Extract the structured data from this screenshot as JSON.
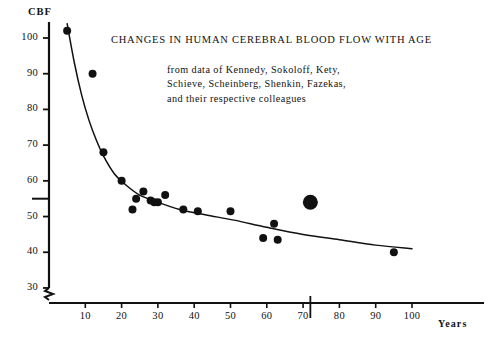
{
  "figure": {
    "title": "CHANGES IN HUMAN CEREBRAL BLOOD FLOW WITH AGE",
    "caption_lines": [
      "from data of Kennedy, Sokoloff, Kety,",
      "Schieve, Scheinberg, Shenkin, Fazekas,",
      "and their respective colleagues"
    ],
    "ink_color": "#111111",
    "background_color": "#ffffff"
  },
  "chart_data": {
    "type": "scatter",
    "title": "CHANGES IN HUMAN CEREBRAL BLOOD FLOW WITH AGE",
    "subtitle": "from data of Kennedy, Sokoloff, Kety, Schieve, Scheinberg, Shenkin, Fazekas, and their respective colleagues",
    "xlabel": "Years",
    "ylabel": "CBF",
    "xlim": [
      0,
      108
    ],
    "ylim": [
      26,
      106
    ],
    "grid": false,
    "legend": null,
    "axis_break": {
      "axis": "y",
      "below_value": 30,
      "symbol": "zigzag"
    },
    "xticks": [
      10,
      20,
      30,
      40,
      50,
      60,
      70,
      80,
      90,
      100
    ],
    "xtick_labels": [
      "10",
      "20",
      "30",
      "40",
      "50",
      "60",
      "70",
      "80",
      "90",
      "100"
    ],
    "yticks": [
      30,
      40,
      50,
      60,
      70,
      80,
      90,
      100
    ],
    "ytick_labels": [
      "30",
      "40",
      "50",
      "60",
      "70",
      "80",
      "90",
      "100"
    ],
    "reference_marks": [
      {
        "name": "y-reference-tick-55",
        "axis": "y",
        "value": 55,
        "style": "extended-tick"
      },
      {
        "name": "x-reference-line-72",
        "axis": "x",
        "value": 72,
        "style": "short-vertical-line"
      }
    ],
    "series": [
      {
        "name": "Observed CBF data points",
        "marker": "filled-circle",
        "color": "#111111",
        "points": [
          {
            "x": 5,
            "y": 102,
            "size": "normal"
          },
          {
            "x": 12,
            "y": 90,
            "size": "normal"
          },
          {
            "x": 15,
            "y": 68,
            "size": "normal"
          },
          {
            "x": 20,
            "y": 60,
            "size": "normal"
          },
          {
            "x": 23,
            "y": 52,
            "size": "normal"
          },
          {
            "x": 24,
            "y": 55,
            "size": "normal"
          },
          {
            "x": 26,
            "y": 57,
            "size": "normal"
          },
          {
            "x": 28,
            "y": 54.5,
            "size": "normal"
          },
          {
            "x": 29,
            "y": 54,
            "size": "normal"
          },
          {
            "x": 30,
            "y": 54,
            "size": "normal"
          },
          {
            "x": 32,
            "y": 56,
            "size": "normal"
          },
          {
            "x": 37,
            "y": 52,
            "size": "normal"
          },
          {
            "x": 41,
            "y": 51.5,
            "size": "normal"
          },
          {
            "x": 50,
            "y": 51.5,
            "size": "normal"
          },
          {
            "x": 59,
            "y": 44,
            "size": "normal"
          },
          {
            "x": 62,
            "y": 48,
            "size": "normal"
          },
          {
            "x": 63,
            "y": 43.5,
            "size": "normal"
          },
          {
            "x": 72,
            "y": 54,
            "size": "large"
          },
          {
            "x": 95,
            "y": 40,
            "size": "normal"
          }
        ]
      },
      {
        "name": "Fitted decline curve",
        "marker": "none",
        "line": "solid",
        "color": "#111111",
        "x": [
          5,
          7,
          9,
          11,
          13,
          15,
          18,
          21,
          25,
          30,
          36,
          43,
          51,
          60,
          70,
          80,
          90,
          100
        ],
        "y": [
          104,
          93,
          84,
          77,
          71.5,
          67,
          62,
          59,
          56,
          54,
          52,
          50.5,
          49,
          47,
          45,
          43.5,
          42,
          41
        ]
      }
    ]
  }
}
